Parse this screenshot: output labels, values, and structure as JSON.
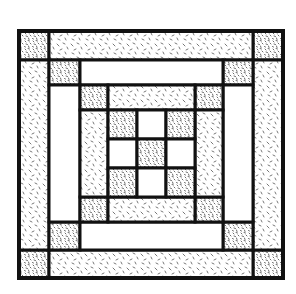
{
  "image": {
    "subject": "Quilt block illustration",
    "description": "Concentric square quilt block with three bordered rings and a 3x3 nine-patch center"
  },
  "colors": {
    "background": "#ffffff",
    "outline": "#111111",
    "texture_ink": "#444444"
  },
  "layout": {
    "outer": {
      "x": 19,
      "y": 31,
      "w": 264,
      "h": 247
    },
    "rings": [
      {
        "name": "ring-1",
        "x0": 19,
        "y0": 31,
        "x1": 283,
        "y1": 278,
        "ix0": 49,
        "iy0": 60,
        "ix1": 253,
        "iy1": 250,
        "sides": "sparse",
        "corners": "dense"
      },
      {
        "name": "ring-2",
        "x0": 49,
        "y0": 60,
        "x1": 253,
        "y1": 250,
        "ix0": 80,
        "iy0": 85,
        "ix1": 223,
        "iy1": 222,
        "sides": "plain",
        "corners": "dense"
      },
      {
        "name": "ring-3",
        "x0": 80,
        "y0": 85,
        "x1": 223,
        "y1": 222,
        "ix0": 108,
        "iy0": 110,
        "ix1": 195,
        "iy1": 197,
        "sides": "sparse",
        "corners": "dense"
      }
    ],
    "center": {
      "x0": 108,
      "y0": 110,
      "x1": 195,
      "y1": 197,
      "grid": [
        [
          "dense",
          "plain",
          "dense"
        ],
        [
          "plain",
          "dense",
          "plain"
        ],
        [
          "dense",
          "plain",
          "dense"
        ]
      ]
    }
  }
}
